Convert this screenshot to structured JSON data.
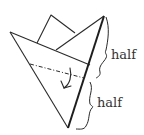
{
  "diagram": {
    "labels": {
      "upper_half": "half",
      "lower_half": "half"
    },
    "colors": {
      "stroke": "#2a2a2a",
      "background": "#ffffff"
    }
  }
}
